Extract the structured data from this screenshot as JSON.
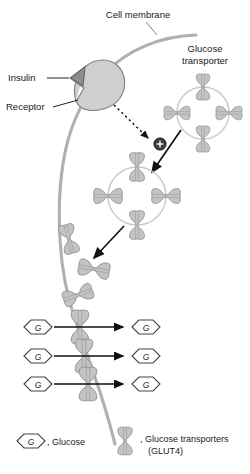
{
  "figure": {
    "type": "biological-process-diagram"
  },
  "labels": {
    "cell_membrane": "Cell membrane",
    "glucose_transporter_line1": "Glucose",
    "glucose_transporter_line2": "transporter",
    "insulin": "Insulin",
    "receptor": "Receptor",
    "plus_sign": "+"
  },
  "glucose_rows": [
    {
      "outside": "G",
      "inside": "G"
    },
    {
      "outside": "G",
      "inside": "G"
    },
    {
      "outside": "G",
      "inside": "G"
    }
  ],
  "legend": {
    "glucose": {
      "glyph_letter": "G",
      "text": ", Glucose"
    },
    "transporter": {
      "text_line1": ", Glucose transporters",
      "text_line2": "(GLUT4)"
    }
  },
  "colors": {
    "membrane": "#b0b0b0",
    "transporter_fill": "#c3c3c3",
    "transporter_stroke": "#8a8a8a",
    "receptor_fill": "#cfcfcf",
    "insulin_fill": "#8d8d8d",
    "vesicle_ring": "#c9c9c9",
    "arrow": "#111111",
    "plus_node": "#3a3a3a",
    "text": "#1a1a1a",
    "background": "#ffffff"
  }
}
